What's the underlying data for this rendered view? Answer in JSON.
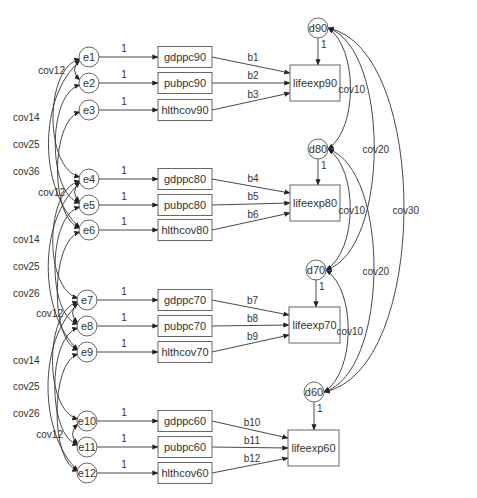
{
  "diagram": {
    "type": "path-diagram",
    "groups": [
      {
        "year": "90",
        "errors": [
          {
            "id": "e1",
            "label": "e1",
            "cx": 89,
            "cy": 57
          },
          {
            "id": "e2",
            "label": "e2",
            "cx": 89,
            "cy": 83
          },
          {
            "id": "e3",
            "label": "e3",
            "cx": 89,
            "cy": 110
          }
        ],
        "predictors": [
          {
            "label": "gdppc90",
            "y": 57,
            "path_label": "b1"
          },
          {
            "label": "pubpc90",
            "y": 83,
            "path_label": "b2"
          },
          {
            "label": "hlthcov90",
            "y": 110,
            "path_label": "b3"
          }
        ],
        "outcome": {
          "label": "lifeexp90",
          "x": 290,
          "y": 65,
          "w": 50,
          "h": 36
        },
        "disturbance": {
          "label": "d90",
          "cx": 318,
          "cy": 28,
          "path_label": "1"
        },
        "error_path_label": "1",
        "cov_inner_label": "cov12"
      },
      {
        "year": "80",
        "errors": [
          {
            "id": "e4",
            "label": "e4",
            "cx": 89,
            "cy": 179
          },
          {
            "id": "e5",
            "label": "e5",
            "cx": 89,
            "cy": 205
          },
          {
            "id": "e6",
            "label": "e6",
            "cx": 89,
            "cy": 230
          }
        ],
        "predictors": [
          {
            "label": "gdppc80",
            "y": 179,
            "path_label": "b4"
          },
          {
            "label": "pubpc80",
            "y": 205,
            "path_label": "b5"
          },
          {
            "label": "hlthcov80",
            "y": 230,
            "path_label": "b6"
          }
        ],
        "outcome": {
          "label": "lifeexp80",
          "x": 290,
          "y": 185,
          "w": 50,
          "h": 36
        },
        "disturbance": {
          "label": "d80",
          "cx": 318,
          "cy": 149,
          "path_label": "1"
        },
        "error_path_label": "1",
        "cov_inner_label": "cov12"
      },
      {
        "year": "70",
        "errors": [
          {
            "id": "e7",
            "label": "e7",
            "cx": 87,
            "cy": 300
          },
          {
            "id": "e8",
            "label": "e8",
            "cx": 87,
            "cy": 326
          },
          {
            "id": "e9",
            "label": "e9",
            "cx": 87,
            "cy": 352
          }
        ],
        "predictors": [
          {
            "label": "gdppc70",
            "y": 300,
            "path_label": "b7"
          },
          {
            "label": "pubpc70",
            "y": 326,
            "path_label": "b8"
          },
          {
            "label": "hlthcov70",
            "y": 352,
            "path_label": "b9"
          }
        ],
        "outcome": {
          "label": "lifeexp70",
          "x": 289,
          "y": 307,
          "w": 51,
          "h": 36
        },
        "disturbance": {
          "label": "d70",
          "cx": 316,
          "cy": 270,
          "path_label": "1"
        },
        "error_path_label": "1",
        "cov_inner_label": "cov12"
      },
      {
        "year": "60",
        "errors": [
          {
            "id": "e10",
            "label": "e10",
            "cx": 87,
            "cy": 421
          },
          {
            "id": "e11",
            "label": "e11",
            "cx": 87,
            "cy": 447
          },
          {
            "id": "e12",
            "label": "e12",
            "cx": 87,
            "cy": 473
          }
        ],
        "predictors": [
          {
            "label": "gdppc60",
            "y": 421,
            "path_label": "b10"
          },
          {
            "label": "pubpc60",
            "y": 447,
            "path_label": "b11"
          },
          {
            "label": "hlthcov60",
            "y": 473,
            "path_label": "b12"
          }
        ],
        "outcome": {
          "label": "lifeexp60",
          "x": 288,
          "y": 430,
          "w": 51,
          "h": 36
        },
        "disturbance": {
          "label": "d60",
          "cx": 314,
          "cy": 392,
          "path_label": "1"
        },
        "error_path_label": "1",
        "cov_inner_label": "cov12"
      }
    ],
    "error_covariances_between_groups": [
      {
        "labels": [
          "cov14",
          "cov25",
          "cov36"
        ],
        "between": [
          "90",
          "80"
        ],
        "label_ys": [
          117,
          144,
          171
        ]
      },
      {
        "labels": [
          "cov14",
          "cov25",
          "cov26"
        ],
        "between": [
          "80",
          "70"
        ],
        "label_ys": [
          239,
          266,
          293
        ]
      },
      {
        "labels": [
          "cov14",
          "cov25",
          "cov26"
        ],
        "between": [
          "70",
          "60"
        ],
        "label_ys": [
          360,
          386,
          413
        ]
      }
    ],
    "disturbance_covariances": [
      {
        "from": "d90",
        "to": "d80",
        "label": "cov10"
      },
      {
        "from": "d80",
        "to": "d70",
        "label": "cov10"
      },
      {
        "from": "d70",
        "to": "d60",
        "label": "cov10"
      },
      {
        "from": "d90",
        "to": "d70",
        "label": "cov20"
      },
      {
        "from": "d80",
        "to": "d60",
        "label": "cov20"
      },
      {
        "from": "d90",
        "to": "d60",
        "label": "cov30"
      }
    ],
    "colors": {
      "stroke": "#333333",
      "shape_stroke": "#666666",
      "text": "#333333",
      "background": "#ffffff"
    }
  }
}
